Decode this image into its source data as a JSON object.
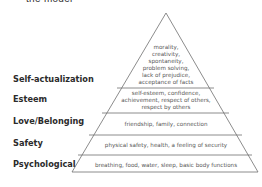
{
  "header": {
    "cut_title": "the model"
  },
  "pyramid": {
    "stroke_color": "#6e6e6e",
    "levels": [
      {
        "label": "Self-actualization",
        "description": [
          "morality,",
          "creativity,",
          "spontaneity,",
          "problem solving,",
          "lack of prejudice,",
          "acceptance of facts"
        ]
      },
      {
        "label": "Esteem",
        "description": [
          "self-esteem, confidence,",
          "achievement, respect of others,",
          "respect by others"
        ]
      },
      {
        "label": "Love/Belonging",
        "description": [
          "friendship, family, connection"
        ]
      },
      {
        "label": "Safety",
        "description": [
          "physical safety, health, a feeling of security"
        ]
      },
      {
        "label": "Psychological",
        "description": [
          "breathing, food, water, sleep, basic body functions"
        ]
      }
    ]
  }
}
